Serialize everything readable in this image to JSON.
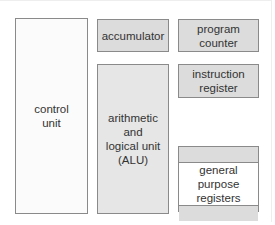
{
  "diagram": {
    "colors": {
      "border": "#8a8a8a",
      "register_fill": "#dcdcdc",
      "alu_fill": "#e6e6e6",
      "control_fill": "#fbfbfb",
      "text": "#333333"
    },
    "blocks": {
      "control_unit": {
        "label": "control\nunit"
      },
      "accumulator": {
        "label": "accumulator"
      },
      "alu": {
        "label": "arithmetic\nand\nlogical unit\n(ALU)"
      },
      "program_counter": {
        "label": "program\ncounter"
      },
      "instruction_register": {
        "label": "instruction\nregister"
      },
      "general_purpose_registers": {
        "label": "general purpose\nregisters"
      }
    }
  }
}
